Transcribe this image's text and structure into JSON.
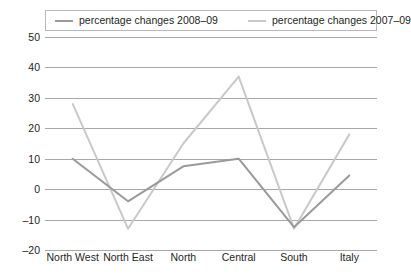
{
  "chart_data": {
    "type": "line",
    "title": "",
    "xlabel": "",
    "ylabel": "",
    "categories": [
      "North West",
      "North East",
      "North",
      "Central",
      "South",
      "Italy"
    ],
    "series": [
      {
        "name": "percentage changes 2008–09",
        "color": "#9a9a9a",
        "values": [
          10,
          -4,
          7.5,
          10,
          -12.5,
          4.5
        ]
      },
      {
        "name": "percentage changes 2007–09",
        "color": "#c9c9c9",
        "values": [
          28,
          -13,
          15,
          37,
          -13,
          18
        ]
      }
    ],
    "ylim": [
      -20,
      50
    ],
    "ystep": 10,
    "yticks": [
      "50",
      "40",
      "30",
      "20",
      "10",
      "0",
      "–10",
      "–20"
    ],
    "ytick_values": [
      50,
      40,
      30,
      20,
      10,
      0,
      -10,
      -20
    ],
    "grid": true,
    "legend_position": "top"
  },
  "colors": {
    "grid": "#a8a8a8",
    "text": "#231f20",
    "legend_border": "#b9b9b9",
    "series_2008_09": "#9a9a9a",
    "series_2007_09": "#c9c9c9"
  }
}
